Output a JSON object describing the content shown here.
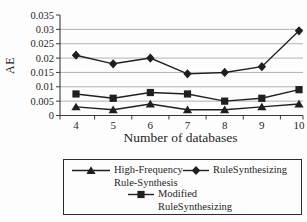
{
  "chart_data": {
    "type": "line",
    "title": "",
    "xlabel": "Number of databases",
    "ylabel": "AE",
    "categories": [
      4,
      5,
      6,
      7,
      8,
      9,
      10
    ],
    "series": [
      {
        "name": "High-Frequency-Rule-Synthesis",
        "marker": "triangle",
        "values": [
          0.003,
          0.002,
          0.004,
          0.002,
          0.002,
          0.003,
          0.004
        ]
      },
      {
        "name": "RuleSynthesizing",
        "marker": "diamond",
        "values": [
          0.021,
          0.018,
          0.02,
          0.0145,
          0.015,
          0.017,
          0.0295
        ]
      },
      {
        "name": "Modified RuleSynthesizing",
        "marker": "square",
        "values": [
          0.0075,
          0.006,
          0.008,
          0.0075,
          0.005,
          0.006,
          0.009
        ]
      }
    ],
    "ylim": [
      0,
      0.035
    ],
    "ytick_step": 0.005,
    "ytick_labels": [
      "0",
      "0.005",
      "0.01",
      "0.015",
      "0.02",
      "0.025",
      "0.03",
      "0.035"
    ],
    "grid": true,
    "legend_position": "bottom",
    "line_color": "#1f1f1f",
    "grid_color": "#a9a9a9",
    "axis_color": "#3a3a3a"
  },
  "legend": {
    "entries": [
      {
        "marker": "triangle",
        "label_lines": [
          "High-Frequency-",
          "Rule-Synthesis"
        ]
      },
      {
        "marker": "diamond",
        "label_lines": [
          "RuleSynthesizing"
        ]
      },
      {
        "marker": "square",
        "label_lines": [
          "Modified",
          "RuleSynthesizing"
        ]
      }
    ]
  }
}
